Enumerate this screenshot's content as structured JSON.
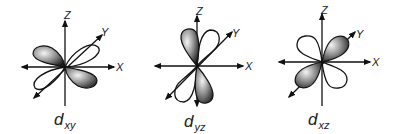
{
  "axis_labels": {
    "z": "Z",
    "y": "Y",
    "x": "X"
  },
  "orbitals": [
    {
      "name": "d",
      "subscript": "xy",
      "shaded_lobes": "upper-left / lower-right in xy-plane",
      "open_lobes": "along ±Y diagonal"
    },
    {
      "name": "d",
      "subscript": "yz",
      "shaded_lobes": "upper / lower along Z",
      "open_lobes": "along ±Y diagonal"
    },
    {
      "name": "d",
      "subscript": "xz",
      "shaded_lobes": "upper-right / lower-left diagonal",
      "open_lobes": "upper-left / lower-right"
    }
  ],
  "colors": {
    "stroke": "#111111",
    "shade_dark": "#222222",
    "shade_light": "#f2f2f2",
    "background": "#ffffff"
  }
}
